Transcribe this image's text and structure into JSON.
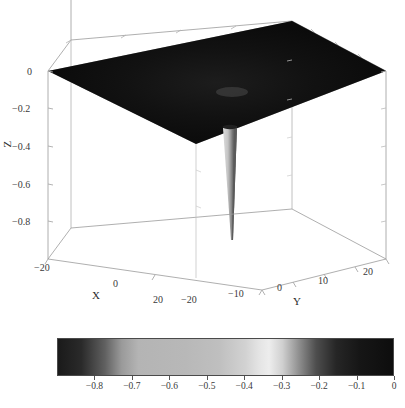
{
  "figure": {
    "background_color": "#ffffff",
    "axis_line_color": "#808080",
    "text_color": "#3a3a3a"
  },
  "chart_data": {
    "type": "surface",
    "title": "",
    "xlabel": "X",
    "ylabel": "Y",
    "zlabel": "Z",
    "xlim": [
      -20,
      20
    ],
    "ylim": [
      -20,
      20
    ],
    "zlim": [
      -1.0,
      0.0
    ],
    "xticks": [
      -20,
      0,
      20
    ],
    "xtick_labels": [
      "−20",
      "0",
      "20"
    ],
    "yticks": [
      -20,
      -10,
      0,
      10,
      20
    ],
    "ytick_labels": [
      "−20",
      "−10",
      "0",
      "10",
      "20"
    ],
    "zticks": [
      0,
      -0.2,
      -0.4,
      -0.6,
      -0.8
    ],
    "ztick_labels": [
      "0",
      "−0.2",
      "−0.4",
      "−0.6",
      "−0.8"
    ],
    "grid": false,
    "legend": null,
    "surface_plane_z": 0.0,
    "spike": {
      "depth": -1.0,
      "x": 5,
      "y": -2,
      "shading_left": "#c8c8c8",
      "shading_right": "#6e6e6e"
    },
    "surface_color_dominant": "#0b0b0b",
    "colormap": "gray-peaked",
    "colorbar": {
      "orientation": "horizontal",
      "vmin": -0.9,
      "vmax": 0.0,
      "ticks": [
        -0.8,
        -0.7,
        -0.6,
        -0.5,
        -0.4,
        -0.3,
        -0.2,
        -0.1,
        0
      ],
      "tick_labels": [
        "−0.8",
        "−0.7",
        "−0.6",
        "−0.5",
        "−0.4",
        "−0.3",
        "−0.2",
        "−0.1",
        "0"
      ],
      "gradient_stops": [
        {
          "pos": 0,
          "color": "#1a1a1a"
        },
        {
          "pos": 7,
          "color": "#2a2a2a"
        },
        {
          "pos": 14,
          "color": "#606060"
        },
        {
          "pos": 19,
          "color": "#9a9a9a"
        },
        {
          "pos": 24,
          "color": "#b4b4b4"
        },
        {
          "pos": 38,
          "color": "#b8b8b8"
        },
        {
          "pos": 48,
          "color": "#bfbfbf"
        },
        {
          "pos": 56,
          "color": "#d2d2d2"
        },
        {
          "pos": 60,
          "color": "#e4e4e4"
        },
        {
          "pos": 63,
          "color": "#ededed"
        },
        {
          "pos": 67,
          "color": "#d0d0d0"
        },
        {
          "pos": 72,
          "color": "#8e8e8e"
        },
        {
          "pos": 77,
          "color": "#4e4e4e"
        },
        {
          "pos": 83,
          "color": "#262626"
        },
        {
          "pos": 90,
          "color": "#161616"
        },
        {
          "pos": 100,
          "color": "#0d0d0d"
        }
      ]
    }
  },
  "geometry": {
    "box_top_back": "71,40",
    "box_top_left": "48,71",
    "box_top_right": "292,21",
    "box_top_front": "386,71",
    "box_bottom_left": "48,259",
    "box_bottom_front": "262,290",
    "box_bottom_right": "386,259"
  }
}
